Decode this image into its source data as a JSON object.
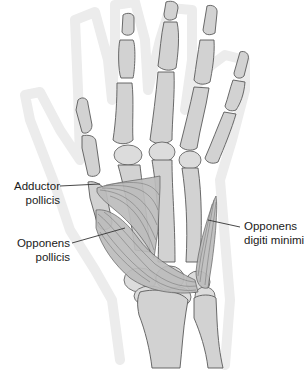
{
  "figure": {
    "colors": {
      "bone_fill": "#d2d2d2",
      "bone_outline": "#5a5a5a",
      "muscle_fill": "#bcbcbc",
      "skin_outline": "#ececec",
      "label_text": "#1a1a1a",
      "background": "#ffffff"
    }
  },
  "labels": {
    "adductor_pollicis": {
      "line1": "Adductor",
      "line2": "pollicis"
    },
    "opponens_pollicis": {
      "line1": "Opponens",
      "line2": "pollicis"
    },
    "opponens_digiti_minimi": {
      "line1": "Opponens",
      "line2": "digiti minimi"
    }
  }
}
